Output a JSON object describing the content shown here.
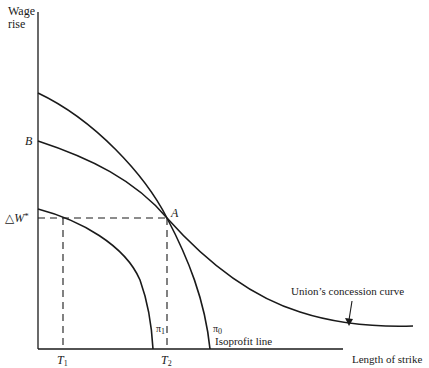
{
  "axes": {
    "y_label_line1": "Wage",
    "y_label_line2": "rise",
    "x_label": "Length of strike"
  },
  "points": {
    "B": "B",
    "A": "A",
    "delta_w": "△W",
    "delta_w_star": "*"
  },
  "ticks": {
    "T1_main": "T",
    "T1_sub": "1",
    "T2_main": "T",
    "T2_sub": "2"
  },
  "curves": {
    "pi1_main": "π",
    "pi1_sub": "1",
    "pi0_main": "π",
    "pi0_sub": "0",
    "isoprofit_label": "Isoprofit line",
    "concession_label": "Union’s concession curve"
  },
  "colors": {
    "ink": "#1a1a1a",
    "background": "#ffffff"
  }
}
